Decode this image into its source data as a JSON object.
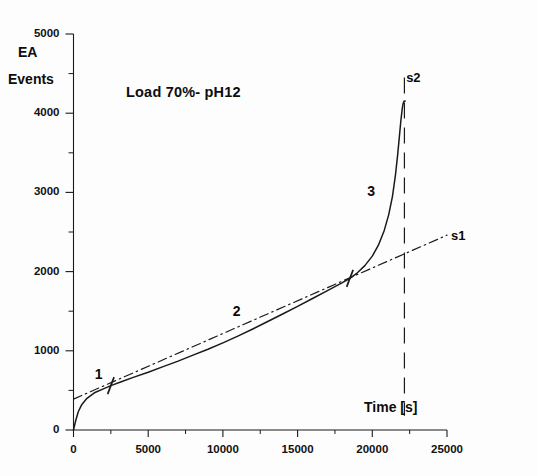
{
  "figure": {
    "background": "#fdfdfd",
    "ink_color": "#1a1a1a"
  },
  "chart_data": {
    "type": "line",
    "title": "Load 70%- pH12",
    "xlabel": "Time [s]",
    "ylabel": "EA Events",
    "ylabel_line1": "EA",
    "ylabel_line2": "Events",
    "xlim": [
      0,
      25000
    ],
    "ylim": [
      0,
      5000
    ],
    "xticks": [
      0,
      5000,
      10000,
      15000,
      20000,
      25000
    ],
    "xtick_labels": [
      "0",
      "5000",
      "10000",
      "15000",
      "20000",
      "25000"
    ],
    "xminor_step": 2500,
    "yticks": [
      0,
      1000,
      2000,
      3000,
      4000,
      5000
    ],
    "ytick_labels": [
      "0",
      "1000",
      "2000",
      "3000",
      "4000",
      "5000"
    ],
    "yminor_step": 500,
    "grid": false,
    "legend_position": "inline-annotations",
    "series": [
      {
        "name": "acoustic-emission-cumulative-events",
        "style": "solid",
        "points": [
          [
            0,
            0
          ],
          [
            150,
            120
          ],
          [
            320,
            230
          ],
          [
            550,
            320
          ],
          [
            900,
            400
          ],
          [
            1400,
            470
          ],
          [
            2000,
            520
          ],
          [
            2500,
            560
          ],
          [
            3200,
            610
          ],
          [
            4000,
            665
          ],
          [
            5000,
            730
          ],
          [
            6000,
            800
          ],
          [
            7000,
            870
          ],
          [
            8000,
            945
          ],
          [
            9000,
            1020
          ],
          [
            10000,
            1100
          ],
          [
            11000,
            1185
          ],
          [
            12000,
            1275
          ],
          [
            13000,
            1370
          ],
          [
            14000,
            1465
          ],
          [
            15000,
            1560
          ],
          [
            16000,
            1660
          ],
          [
            17000,
            1760
          ],
          [
            18000,
            1860
          ],
          [
            18500,
            1915
          ],
          [
            19000,
            1985
          ],
          [
            19500,
            2075
          ],
          [
            20000,
            2195
          ],
          [
            20400,
            2330
          ],
          [
            20800,
            2520
          ],
          [
            21100,
            2720
          ],
          [
            21350,
            2950
          ],
          [
            21550,
            3220
          ],
          [
            21700,
            3480
          ],
          [
            21820,
            3720
          ],
          [
            21920,
            3920
          ],
          [
            22000,
            4050
          ],
          [
            22060,
            4120
          ],
          [
            22120,
            4150
          ],
          [
            22200,
            4155
          ]
        ]
      },
      {
        "name": "s1-linear-fit",
        "style": "dash-dot",
        "points": [
          [
            0,
            390
          ],
          [
            25000,
            2460
          ]
        ]
      }
    ],
    "annotations": [
      {
        "name": "stage-1",
        "text": "1",
        "x": 1750,
        "y": 700
      },
      {
        "name": "stage-2",
        "text": "2",
        "x": 11000,
        "y": 1490
      },
      {
        "name": "stage-3",
        "text": "3",
        "x": 20000,
        "y": 3010
      },
      {
        "name": "slope-s1",
        "text": "s1",
        "x": 25600,
        "y": 2440
      },
      {
        "name": "slope-s2",
        "text": "s2",
        "x": 22600,
        "y": 4430
      }
    ],
    "markers": [
      {
        "name": "transition-1-2",
        "x": 2500,
        "y": 560
      },
      {
        "name": "transition-2-3",
        "x": 18500,
        "y": 1915
      }
    ],
    "vertical_line": {
      "name": "s2-failure-line",
      "x": 22150,
      "style": "dashed"
    }
  }
}
